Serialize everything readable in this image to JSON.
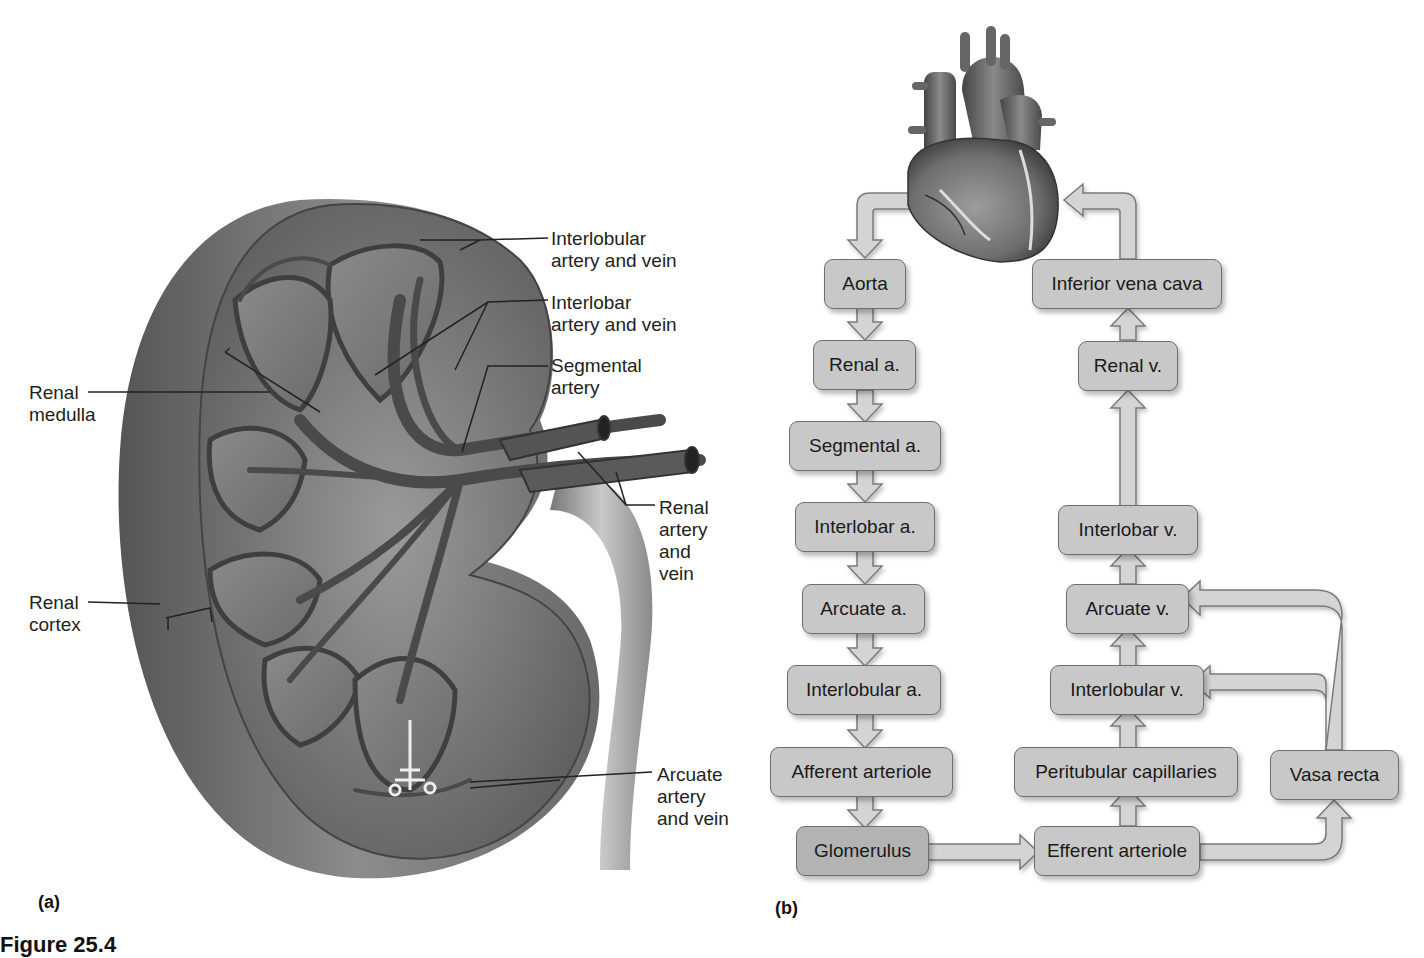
{
  "panel_a": {
    "letter": "(a)",
    "labels": {
      "interlobular": "Interlobular\nartery and vein",
      "interlobar": "Interlobar\nartery and vein",
      "segmental": "Segmental\nartery",
      "renal_medulla": "Renal\nmedulla",
      "renal_cortex": "Renal\ncortex",
      "renal_artery_vein": "Renal\nartery\nand\nvein",
      "arcuate": "Arcuate\nartery\nand vein"
    }
  },
  "panel_b": {
    "letter": "(b)",
    "boxes": {
      "aorta": "Aorta",
      "renal_a": "Renal a.",
      "segmental_a": "Segmental a.",
      "interlobar_a": "Interlobar a.",
      "arcuate_a": "Arcuate a.",
      "interlobular_a": "Interlobular a.",
      "afferent_arteriole": "Afferent arteriole",
      "glomerulus": "Glomerulus",
      "efferent_arteriole": "Efferent arteriole",
      "peritubular_capillaries": "Peritubular capillaries",
      "vasa_recta": "Vasa recta",
      "interlobular_v": "Interlobular v.",
      "arcuate_v": "Arcuate v.",
      "interlobar_v": "Interlobar v.",
      "renal_v": "Renal v.",
      "inferior_vena_cava": "Inferior vena cava"
    }
  },
  "caption": "Figure 25.4"
}
